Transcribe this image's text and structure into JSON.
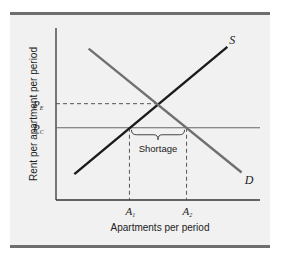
{
  "chart_data": {
    "type": "line",
    "title": "",
    "xlabel": "Apartments per period",
    "ylabel": "Rent per apartment per period",
    "xlim": [
      0,
      10
    ],
    "ylim": [
      0,
      10
    ],
    "grid": false,
    "series": [
      {
        "name": "S",
        "label": "S",
        "color": "#1a1a1a",
        "points": [
          [
            0.9,
            1.5
          ],
          [
            8.4,
            8.9
          ]
        ]
      },
      {
        "name": "D",
        "label": "D",
        "color": "#707070",
        "points": [
          [
            1.6,
            8.8
          ],
          [
            9.1,
            1.6
          ]
        ]
      }
    ],
    "price_levels": [
      {
        "name": "P_E",
        "label": "P",
        "subscript": "E",
        "value": 5.6,
        "style": "dashed"
      },
      {
        "name": "P_C",
        "label": "P",
        "subscript": "C",
        "value": 4.2,
        "style": "solid"
      }
    ],
    "quantity_levels": [
      {
        "name": "A1",
        "label": "A",
        "subscript": "1",
        "value": 3.6
      },
      {
        "name": "A2",
        "label": "A",
        "subscript": "2",
        "value": 6.4
      }
    ],
    "annotations": [
      {
        "text": "Shortage",
        "from_x": 3.6,
        "to_x": 6.4,
        "at_y": 4.2
      }
    ]
  }
}
